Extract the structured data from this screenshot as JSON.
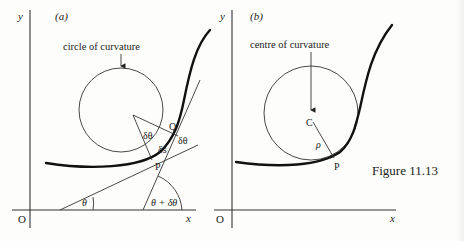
{
  "figure": {
    "caption": "Figure 11.13"
  },
  "panel_a": {
    "label": "(a)",
    "y_axis_label": "y",
    "x_axis_label": "x",
    "origin_label": "O",
    "annotation": "circle of curvature",
    "point_p": "P",
    "point_q": "Q",
    "arc_label": "δs",
    "angle_center": "δθ",
    "angle_tangents": "δθ",
    "angle_theta": "θ",
    "angle_theta_plus": "θ + δθ"
  },
  "panel_b": {
    "label": "(b)",
    "y_axis_label": "y",
    "x_axis_label": "x",
    "origin_label": "O",
    "annotation": "centre of curvature",
    "point_c": "C",
    "point_p": "P",
    "radius_label": "ρ"
  }
}
